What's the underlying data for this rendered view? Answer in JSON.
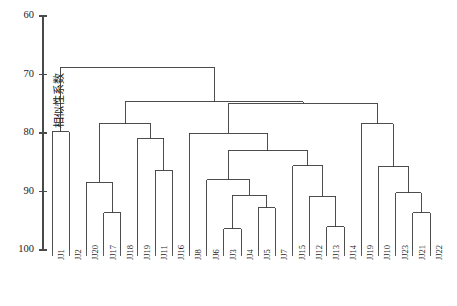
{
  "chart_data": {
    "type": "dendrogram",
    "title": "",
    "xlabel": "",
    "ylabel": "相似性系数",
    "ylim": [
      60,
      100
    ],
    "y_inverted": true,
    "yticks": [
      60,
      70,
      80,
      90,
      100
    ],
    "ytick_labels": [
      "60",
      "70",
      "80",
      "90",
      "100"
    ],
    "grid": false,
    "legend": null,
    "leaf_order": [
      "JJ1",
      "JJ2",
      "JJ20",
      "JJ17",
      "JJ18",
      "JJ19",
      "JJ11",
      "JJ16",
      "JJ8",
      "JJ6",
      "JJ3",
      "JJ4",
      "JJ5",
      "JJ7",
      "JJ15",
      "JJ12",
      "JJ13",
      "JJ14",
      "JJ19",
      "JJ10",
      "JJ23",
      "JJ21",
      "JJ22"
    ],
    "leaf_count": 23,
    "merges": [
      {
        "id": "m1",
        "left": "JJ1",
        "right": "JJ2",
        "height": 79.8
      },
      {
        "id": "m2",
        "left": "JJ17",
        "right": "JJ18",
        "height": 93.6
      },
      {
        "id": "m3",
        "left": "JJ20",
        "right": "m2",
        "height": 88.4
      },
      {
        "id": "m4",
        "left": "JJ11",
        "right": "JJ16",
        "height": 86.4
      },
      {
        "id": "m5",
        "left": "JJ19",
        "right": "m4",
        "height": 80.9
      },
      {
        "id": "m6",
        "left": "m3",
        "right": "m5",
        "height": 78.4
      },
      {
        "id": "m7",
        "left": "JJ3",
        "right": "JJ4",
        "height": 96.4
      },
      {
        "id": "m8",
        "left": "JJ5",
        "right": "JJ7",
        "height": 92.8
      },
      {
        "id": "m9",
        "left": "m7",
        "right": "m8",
        "height": 90.6
      },
      {
        "id": "m10",
        "left": "JJ6",
        "right": "m9",
        "height": 88.0
      },
      {
        "id": "m11",
        "left": "JJ13",
        "right": "JJ14",
        "height": 96.0
      },
      {
        "id": "m12",
        "left": "JJ12",
        "right": "m11",
        "height": 90.8
      },
      {
        "id": "m13",
        "left": "JJ15",
        "right": "m12",
        "height": 85.6
      },
      {
        "id": "m14",
        "left": "m10",
        "right": "m13",
        "height": 83.0
      },
      {
        "id": "m15",
        "left": "JJ8",
        "right": "m14",
        "height": 80.0
      },
      {
        "id": "m16",
        "left": "JJ21",
        "right": "JJ22",
        "height": 93.6
      },
      {
        "id": "m17",
        "left": "JJ23",
        "right": "m16",
        "height": 90.2
      },
      {
        "id": "m18",
        "left": "JJ10",
        "right": "m17",
        "height": 85.8
      },
      {
        "id": "m19",
        "left": "JJ19b",
        "right": "m18",
        "height": 78.4
      },
      {
        "id": "m20",
        "left": "m15",
        "right": "m19",
        "height": 74.9
      },
      {
        "id": "m21",
        "left": "m6",
        "right": "m20",
        "height": 74.7
      },
      {
        "id": "m22",
        "left": "m1",
        "right": "m21",
        "height": 68.8
      }
    ]
  },
  "axes": {
    "y_axis_label": "相似性系数",
    "y_tick_values": [
      "60",
      "70",
      "80",
      "90",
      "100"
    ]
  },
  "leaves": [
    {
      "label": "JJ1"
    },
    {
      "label": "JJ2"
    },
    {
      "label": "JJ20"
    },
    {
      "label": "JJ17"
    },
    {
      "label": "JJ18"
    },
    {
      "label": "JJ19"
    },
    {
      "label": "JJ11"
    },
    {
      "label": "JJ16"
    },
    {
      "label": "JJ8"
    },
    {
      "label": "JJ6"
    },
    {
      "label": "JJ3"
    },
    {
      "label": "JJ4"
    },
    {
      "label": "JJ5"
    },
    {
      "label": "JJ7"
    },
    {
      "label": "JJ15"
    },
    {
      "label": "JJ12"
    },
    {
      "label": "JJ13"
    },
    {
      "label": "JJ14"
    },
    {
      "label": "JJ19"
    },
    {
      "label": "JJ10"
    },
    {
      "label": "JJ23"
    },
    {
      "label": "JJ21"
    },
    {
      "label": "JJ22"
    }
  ],
  "style": {
    "line_color": "#3a3a3a",
    "axis_color": "#4a4a4a",
    "background": "#ffffff"
  }
}
